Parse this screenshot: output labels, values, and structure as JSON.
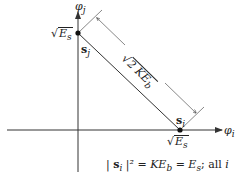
{
  "axes": {
    "vertical_label": "φ",
    "vertical_sub": "j",
    "horizontal_label": "φ",
    "horizontal_sub": "i"
  },
  "points": {
    "sj": {
      "label": "s",
      "sub": "j",
      "value_label": "E",
      "value_sub": "s"
    },
    "si": {
      "label": "s",
      "sub": "i",
      "value_label": "E",
      "value_sub": "s"
    }
  },
  "distance": {
    "radical": "√",
    "text": "2 KE",
    "sub": "b"
  },
  "equation": {
    "bar": "|",
    "vec": "s",
    "vec_sub": "i",
    "rest": "|² = KE",
    "rest_sub": "b",
    "eq2": " = E",
    "eq2_sub": "s",
    "tail": "; all ",
    "tail_var": "i"
  },
  "colors": {
    "line": "#333333",
    "dot": "#111111"
  }
}
